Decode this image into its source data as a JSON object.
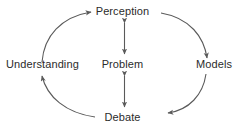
{
  "diagram": {
    "background_color": "#ffffff",
    "stroke_color": "#5a5a5a",
    "text_color": "#2b2b2b",
    "nodes": [
      {
        "id": "perception",
        "label": "Perception",
        "position": "top"
      },
      {
        "id": "models",
        "label": "Models",
        "position": "right"
      },
      {
        "id": "debate",
        "label": "Debate",
        "position": "bottom"
      },
      {
        "id": "understanding",
        "label": "Understanding",
        "position": "left"
      },
      {
        "id": "problem",
        "label": "Problem",
        "position": "center"
      }
    ],
    "edges": [
      {
        "from": "understanding",
        "to": "perception",
        "style": "curved-arc",
        "direction": "one-way",
        "arrow": "right"
      },
      {
        "from": "perception",
        "to": "models",
        "style": "curved-arc",
        "direction": "one-way",
        "arrow": "down"
      },
      {
        "from": "models",
        "to": "debate",
        "style": "curved-arc",
        "direction": "one-way",
        "arrow": "left"
      },
      {
        "from": "debate",
        "to": "understanding",
        "style": "curved-arc",
        "direction": "one-way",
        "arrow": "up"
      },
      {
        "from": "perception",
        "to": "problem",
        "style": "straight",
        "direction": "two-way",
        "arrow": "both"
      },
      {
        "from": "problem",
        "to": "debate",
        "style": "straight",
        "direction": "two-way",
        "arrow": "both"
      }
    ]
  }
}
